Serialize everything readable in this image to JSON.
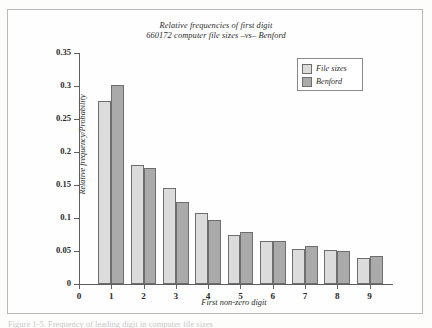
{
  "figure": {
    "background_color": "#fdfdfc",
    "frame_color": "#b9b9b9"
  },
  "caption": {
    "text": "Figure 1-5. Frequency of leading digit in computer file sizes"
  },
  "chart_data": {
    "type": "bar",
    "title": "Relative frequencies of first digit",
    "subtitle": "660172 computer file sizes –vs– Benford",
    "xlabel": "First non-zero digit",
    "ylabel": "Relative frequency/Probability",
    "categories": [
      "1",
      "2",
      "3",
      "4",
      "5",
      "6",
      "7",
      "8",
      "9"
    ],
    "xtick_labels": [
      "0",
      "1",
      "2",
      "3",
      "4",
      "5",
      "6",
      "7",
      "8",
      "9"
    ],
    "ytick_labels": [
      "0",
      "0.05",
      "0.1",
      "0.15",
      "0.2",
      "0.25",
      "0.3",
      "0.35"
    ],
    "ytick_values": [
      0,
      0.05,
      0.1,
      0.15,
      0.2,
      0.25,
      0.3,
      0.35
    ],
    "ylim": [
      0,
      0.35
    ],
    "xlim": [
      0,
      9.6
    ],
    "grid": false,
    "legend_position": "top-right",
    "series": [
      {
        "name": "File sizes",
        "color": "#dcdcdc",
        "values": [
          0.277,
          0.18,
          0.145,
          0.108,
          0.075,
          0.065,
          0.053,
          0.052,
          0.04
        ]
      },
      {
        "name": "Benford",
        "color": "#aaaaaa",
        "values": [
          0.301,
          0.176,
          0.125,
          0.097,
          0.079,
          0.065,
          0.057,
          0.05,
          0.043
        ]
      }
    ]
  }
}
